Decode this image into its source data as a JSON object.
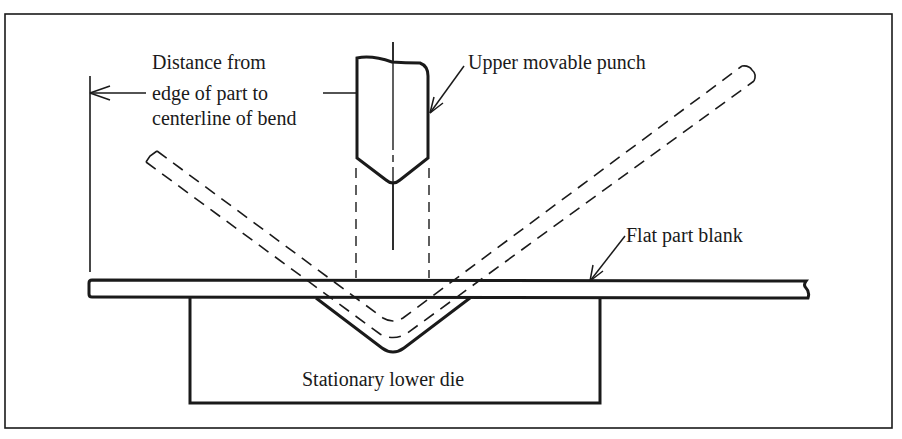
{
  "figure": {
    "colors": {
      "ink": "#1a1a1a",
      "background": "#ffffff"
    }
  },
  "labels": {
    "distance_line1": "Distance from",
    "distance_line2": "edge of part to",
    "distance_line3": "centerline of bend",
    "punch": "Upper movable punch",
    "blank": "Flat part blank",
    "die": "Stationary lower die"
  }
}
